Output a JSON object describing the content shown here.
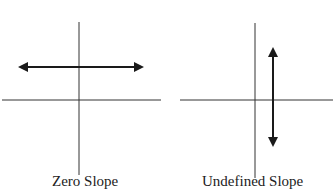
{
  "diagrams": [
    {
      "id": "zero",
      "label": "Zero Slope",
      "axes": {
        "vertical_x": 79,
        "vertical_y1": 22,
        "vertical_y2": 175,
        "horizontal_y": 100,
        "horizontal_x1": 2,
        "horizontal_x2": 161
      },
      "line": {
        "orientation": "horizontal",
        "x1": 18,
        "x2": 144,
        "y": 67
      }
    },
    {
      "id": "undefined",
      "label": "Undefined Slope",
      "axes": {
        "vertical_x": 255,
        "vertical_y1": 23,
        "vertical_y2": 178,
        "horizontal_y": 100,
        "horizontal_x1": 180,
        "horizontal_x2": 333
      },
      "line": {
        "orientation": "vertical",
        "x": 273,
        "y1": 47,
        "y2": 147
      }
    }
  ],
  "colors": {
    "axis": "#333333",
    "line": "#1a1a1a"
  }
}
